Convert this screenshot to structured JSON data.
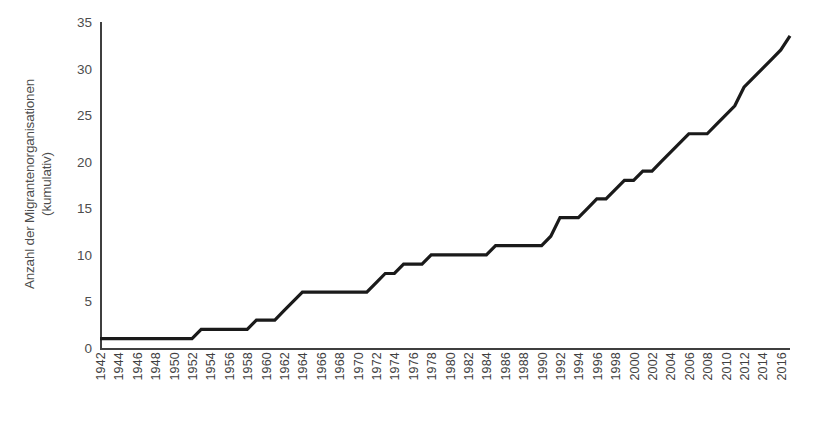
{
  "chart_data": {
    "type": "line",
    "title": "",
    "xlabel": "",
    "ylabel": "Anzahl der Migrantenorganisationen\n(kumulativ)",
    "ylim": [
      0,
      35
    ],
    "yticks": [
      0,
      5,
      10,
      15,
      20,
      25,
      30,
      35
    ],
    "ytick_labels": [
      "0",
      "5",
      "10",
      "15",
      "20",
      "25",
      "30",
      "35"
    ],
    "xlim": [
      1942,
      2017
    ],
    "xticks": [
      1942,
      1944,
      1946,
      1948,
      1950,
      1952,
      1954,
      1956,
      1958,
      1960,
      1962,
      1964,
      1966,
      1968,
      1970,
      1972,
      1974,
      1976,
      1978,
      1980,
      1982,
      1984,
      1986,
      1988,
      1990,
      1992,
      1994,
      1996,
      1998,
      2000,
      2002,
      2004,
      2006,
      2008,
      2010,
      2012,
      2014,
      2016
    ],
    "xtick_labels": [
      "1942",
      "1944",
      "1946",
      "1948",
      "1950",
      "1952",
      "1954",
      "1956",
      "1958",
      "1960",
      "1962",
      "1964",
      "1966",
      "1968",
      "1970",
      "1972",
      "1974",
      "1976",
      "1978",
      "1980",
      "1982",
      "1984",
      "1986",
      "1988",
      "1990",
      "1992",
      "1994",
      "1996",
      "1998",
      "2000",
      "2002",
      "2004",
      "2006",
      "2008",
      "2010",
      "2012",
      "2014",
      "2016"
    ],
    "grid": false,
    "legend": false,
    "line_color": "#1a1a1a",
    "line_width": 3.2,
    "x": [
      1942,
      1943,
      1944,
      1945,
      1946,
      1947,
      1948,
      1949,
      1950,
      1951,
      1952,
      1953,
      1954,
      1955,
      1956,
      1957,
      1958,
      1959,
      1960,
      1961,
      1962,
      1963,
      1964,
      1965,
      1966,
      1967,
      1968,
      1969,
      1970,
      1971,
      1972,
      1973,
      1974,
      1975,
      1976,
      1977,
      1978,
      1979,
      1980,
      1981,
      1982,
      1983,
      1984,
      1985,
      1986,
      1987,
      1988,
      1989,
      1990,
      1991,
      1992,
      1993,
      1994,
      1995,
      1996,
      1997,
      1998,
      1999,
      2000,
      2001,
      2002,
      2003,
      2004,
      2005,
      2006,
      2007,
      2008,
      2009,
      2010,
      2011,
      2012,
      2013,
      2014,
      2015,
      2016,
      2017
    ],
    "y": [
      1,
      1,
      1,
      1,
      1,
      1,
      1,
      1,
      1,
      1,
      1,
      2,
      2,
      2,
      2,
      2,
      2,
      3,
      3,
      3,
      4,
      5,
      6,
      6,
      6,
      6,
      6,
      6,
      6,
      6,
      7,
      8,
      8,
      9,
      9,
      9,
      10,
      10,
      10,
      10,
      10,
      10,
      10,
      11,
      11,
      11,
      11,
      11,
      11,
      12,
      14,
      14,
      14,
      15,
      16,
      16,
      17,
      18,
      18,
      19,
      19,
      20,
      21,
      22,
      23,
      23,
      23,
      24,
      25,
      26,
      28,
      29,
      30,
      31,
      32,
      33.5
    ],
    "series": [
      {
        "name": "Migrantenorganisationen (kumulativ)",
        "values": [
          1,
          1,
          1,
          1,
          1,
          1,
          1,
          1,
          1,
          1,
          1,
          2,
          2,
          2,
          2,
          2,
          2,
          3,
          3,
          3,
          4,
          5,
          6,
          6,
          6,
          6,
          6,
          6,
          6,
          6,
          7,
          8,
          8,
          9,
          9,
          9,
          10,
          10,
          10,
          10,
          10,
          10,
          10,
          11,
          11,
          11,
          11,
          11,
          11,
          12,
          14,
          14,
          14,
          15,
          16,
          16,
          17,
          18,
          18,
          19,
          19,
          20,
          21,
          22,
          23,
          23,
          23,
          24,
          25,
          26,
          28,
          29,
          30,
          31,
          32,
          33.5
        ]
      }
    ]
  }
}
